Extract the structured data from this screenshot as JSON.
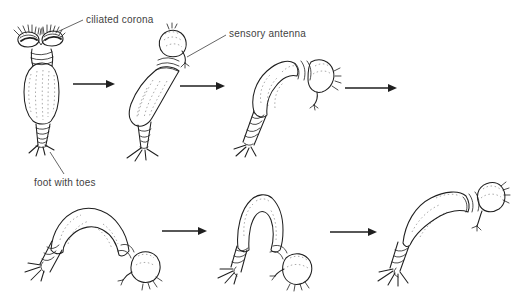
{
  "theme": {
    "ink": "#1f1f1f",
    "label": "#3f3f3f",
    "background": "#ffffff"
  },
  "diagram": {
    "labels": {
      "ciliated_corona": "ciliated corona",
      "sensory_antenna": "sensory antenna",
      "foot_with_toes": "foot with toes"
    }
  }
}
